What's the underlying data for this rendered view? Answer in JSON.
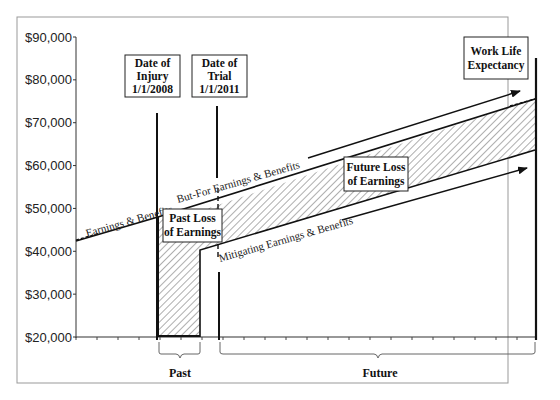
{
  "chart_data": {
    "type": "line",
    "title": "",
    "xlabel": "",
    "ylabel": "",
    "ylim": [
      20000,
      90000
    ],
    "y_ticks": [
      "$90,000",
      "$80,000",
      "$70,000",
      "$60,000",
      "$50,000",
      "$40,000",
      "$30,000",
      "$20,000"
    ],
    "grid": false,
    "series": [
      {
        "name": "Earnings & Benefits",
        "points": [
          {
            "x": "start",
            "y": 42000
          },
          {
            "x": "1/1/2008",
            "y": 47500
          }
        ]
      },
      {
        "name": "But-For Earnings & Benefits",
        "points": [
          {
            "x": "1/1/2008",
            "y": 47500
          },
          {
            "x": "1/1/2011",
            "y": 51500
          },
          {
            "x": "Work Life Expectancy",
            "y": 75000
          }
        ]
      },
      {
        "name": "Mitigating Earnings & Benefits",
        "points": [
          {
            "x": "1/1/2011",
            "y": 40000
          },
          {
            "x": "Work Life Expectancy",
            "y": 63500
          }
        ]
      }
    ],
    "shaded_regions": [
      {
        "name": "Past Loss of Earnings",
        "from": "1/1/2008",
        "to": "1/1/2011",
        "between": [
          "$20,000 baseline / Mitigating",
          "But-For Earnings & Benefits"
        ]
      },
      {
        "name": "Future Loss of Earnings",
        "from": "1/1/2011",
        "to": "Work Life Expectancy",
        "between": [
          "Mitigating Earnings & Benefits",
          "But-For Earnings & Benefits"
        ]
      }
    ],
    "markers": [
      {
        "label": "Date of Injury 1/1/2008"
      },
      {
        "label": "Date of Trial 1/1/2011"
      },
      {
        "label": "Work Life Expectancy"
      }
    ],
    "periods": [
      "Past",
      "Future"
    ]
  },
  "axis": {
    "y_labels": [
      "$90,000",
      "$80,000",
      "$70,000",
      "$60,000",
      "$50,000",
      "$40,000",
      "$30,000",
      "$20,000"
    ]
  },
  "boxes": {
    "injury": [
      "Date of",
      "Injury",
      "1/1/2008"
    ],
    "trial": [
      "Date of",
      "Trial",
      "1/1/2011"
    ],
    "worklife": [
      "Work Life",
      "Expectancy"
    ],
    "past_loss": [
      "Past Loss",
      "of Earnings"
    ],
    "future_loss": [
      "Future Loss",
      "of Earnings"
    ]
  },
  "line_labels": {
    "earnings": "Earnings & Benefits",
    "but_for": "But-For Earnings & Benefits",
    "mitigating": "Mitigating Earnings & Benefits"
  },
  "periods": {
    "past": "Past",
    "future": "Future"
  }
}
